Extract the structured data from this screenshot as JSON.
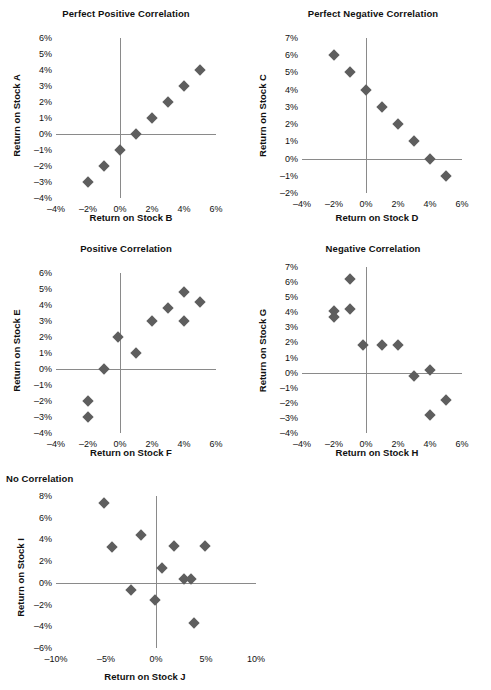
{
  "figure": {
    "panel_count": 5,
    "marker_color": "#5e5e5e",
    "axis_color": "#8a8a8a",
    "text_color": "#111111",
    "background": "#ffffff"
  },
  "chart_data": [
    {
      "type": "scatter",
      "title": "Perfect Positive Correlation",
      "xlabel": "Return on Stock B",
      "ylabel": "Return on Stock A",
      "xlim": [
        -4,
        6
      ],
      "ylim": [
        -4,
        6
      ],
      "xticks": [
        -4,
        -2,
        0,
        2,
        4,
        6
      ],
      "xticklabels": [
        "–4%",
        "–2%",
        "0%",
        "2%",
        "4%",
        "6%"
      ],
      "yticks": [
        6,
        5,
        4,
        3,
        2,
        1,
        0,
        -1,
        -2,
        -3,
        -4
      ],
      "yticklabels": [
        "6%",
        "5%",
        "4%",
        "3%",
        "2%",
        "1%",
        "0%",
        "–1%",
        "–2%",
        "–3%",
        "–4%"
      ],
      "grid": false,
      "legend": "none",
      "points": [
        {
          "x": -2,
          "y": -3
        },
        {
          "x": -1,
          "y": -2
        },
        {
          "x": 0,
          "y": -1
        },
        {
          "x": 1,
          "y": 0
        },
        {
          "x": 2,
          "y": 1
        },
        {
          "x": 3,
          "y": 2
        },
        {
          "x": 4,
          "y": 3
        },
        {
          "x": 5,
          "y": 4
        }
      ]
    },
    {
      "type": "scatter",
      "title": "Perfect Negative Correlation",
      "xlabel": "Return on Stock D",
      "ylabel": "Return on Stock C",
      "xlim": [
        -4,
        6
      ],
      "ylim": [
        -2,
        7
      ],
      "xticks": [
        -4,
        -2,
        0,
        2,
        4,
        6
      ],
      "xticklabels": [
        "–4%",
        "–2%",
        "0%",
        "2%",
        "4%",
        "6%"
      ],
      "yticks": [
        7,
        6,
        5,
        4,
        3,
        2,
        1,
        0,
        -1,
        -2
      ],
      "yticklabels": [
        "7%",
        "6%",
        "5%",
        "4%",
        "3%",
        "2%",
        "1%",
        "0%",
        "–1%",
        "–2%"
      ],
      "grid": false,
      "legend": "none",
      "points": [
        {
          "x": -2,
          "y": 6
        },
        {
          "x": -1,
          "y": 5
        },
        {
          "x": 0,
          "y": 4
        },
        {
          "x": 1,
          "y": 3
        },
        {
          "x": 2,
          "y": 2
        },
        {
          "x": 3,
          "y": 1
        },
        {
          "x": 4,
          "y": 0
        },
        {
          "x": 5,
          "y": -1
        }
      ]
    },
    {
      "type": "scatter",
      "title": "Positive Correlation",
      "xlabel": "Return on Stock F",
      "ylabel": "Return on Stock E",
      "xlim": [
        -4,
        6
      ],
      "ylim": [
        -4,
        6
      ],
      "xticks": [
        -4,
        -2,
        0,
        2,
        4,
        6
      ],
      "xticklabels": [
        "–4%",
        "–2%",
        "0%",
        "2%",
        "4%",
        "6%"
      ],
      "yticks": [
        6,
        5,
        4,
        3,
        2,
        1,
        0,
        -1,
        -2,
        -3,
        -4
      ],
      "yticklabels": [
        "6%",
        "5%",
        "4%",
        "3%",
        "2%",
        "1%",
        "0%",
        "–1%",
        "–2%",
        "–3%",
        "–4%"
      ],
      "grid": false,
      "legend": "none",
      "points": [
        {
          "x": -2,
          "y": -3
        },
        {
          "x": -2,
          "y": -2
        },
        {
          "x": -1,
          "y": 0
        },
        {
          "x": -0.1,
          "y": 2
        },
        {
          "x": 1,
          "y": 1
        },
        {
          "x": 2,
          "y": 3
        },
        {
          "x": 3,
          "y": 3.8
        },
        {
          "x": 4,
          "y": 3
        },
        {
          "x": 4,
          "y": 4.8
        },
        {
          "x": 5,
          "y": 4.2
        }
      ]
    },
    {
      "type": "scatter",
      "title": "Negative Correlation",
      "xlabel": "Return on Stock H",
      "ylabel": "Return on Stock G",
      "xlim": [
        -4,
        6
      ],
      "ylim": [
        -4,
        7
      ],
      "xticks": [
        -4,
        -2,
        0,
        2,
        4,
        6
      ],
      "xticklabels": [
        "–4%",
        "–2%",
        "0%",
        "2%",
        "4%",
        "6%"
      ],
      "yticks": [
        7,
        6,
        5,
        4,
        3,
        2,
        1,
        0,
        -1,
        -2,
        -3,
        -4
      ],
      "yticklabels": [
        "7%",
        "6%",
        "5%",
        "4%",
        "3%",
        "2%",
        "1%",
        "0%",
        "–1%",
        "–2%",
        "–3%",
        "–4%"
      ],
      "grid": false,
      "legend": "none",
      "points": [
        {
          "x": -2,
          "y": 4.1
        },
        {
          "x": -2,
          "y": 3.7
        },
        {
          "x": -1,
          "y": 6.2
        },
        {
          "x": -1,
          "y": 4.2
        },
        {
          "x": -0.2,
          "y": 1.8
        },
        {
          "x": 1,
          "y": 1.8
        },
        {
          "x": 2,
          "y": 1.8
        },
        {
          "x": 3,
          "y": -0.2
        },
        {
          "x": 4,
          "y": 0.2
        },
        {
          "x": 4,
          "y": -2.8
        },
        {
          "x": 5,
          "y": -1.8
        }
      ]
    },
    {
      "type": "scatter",
      "title": "No Correlation",
      "xlabel": "Return on Stock J",
      "ylabel": "Return on Stock I",
      "xlim": [
        -10,
        10
      ],
      "ylim": [
        -6,
        8
      ],
      "xticks": [
        -10,
        -5,
        0,
        5,
        10
      ],
      "xticklabels": [
        "–10%",
        "–5%",
        "0%",
        "5%",
        "10%"
      ],
      "yticks": [
        8,
        6,
        4,
        2,
        0,
        -2,
        -4,
        -6
      ],
      "yticklabels": [
        "8%",
        "6%",
        "4%",
        "2%",
        "0%",
        "–2%",
        "–4%",
        "–6%"
      ],
      "grid": false,
      "legend": "none",
      "points": [
        {
          "x": -5.2,
          "y": 7.4
        },
        {
          "x": -4.4,
          "y": 3.3
        },
        {
          "x": -2.5,
          "y": -0.7
        },
        {
          "x": -1.5,
          "y": 4.4
        },
        {
          "x": -0.1,
          "y": -1.6
        },
        {
          "x": 0.6,
          "y": 1.4
        },
        {
          "x": 1.8,
          "y": 3.4
        },
        {
          "x": 2.8,
          "y": 0.4
        },
        {
          "x": 3.5,
          "y": 0.4
        },
        {
          "x": 3.8,
          "y": -3.7
        },
        {
          "x": 4.9,
          "y": 3.4
        }
      ]
    }
  ]
}
